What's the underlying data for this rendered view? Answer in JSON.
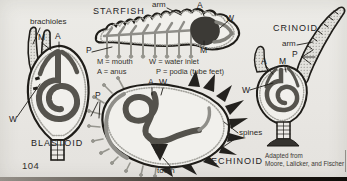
{
  "meta": {
    "page_number": "104"
  },
  "colors": {
    "paper": "#e9e7e3",
    "ink": "#1f1d19",
    "gut_dark_gray": "#56544e",
    "stomach_dark": "#3c3a36",
    "water_system_gray": "#8f8e89",
    "bottom_bar_dark": "#17120e"
  },
  "legend": {
    "m": "M = mouth",
    "a": "A = anus",
    "w": "W = water inlet",
    "p": "P = podia (tube feet)"
  },
  "credit": {
    "line1": "Adapted from",
    "line2": "Moore, Lalicker, and Fischer"
  },
  "figures": {
    "blastoid": {
      "title": "BLASTOID",
      "brachioles_label": "brachioles",
      "mouth": "M",
      "anus": "A",
      "water_inlet": "W"
    },
    "starfish": {
      "title": "STARFISH",
      "arm_label": "arm",
      "mouth": "M",
      "anus": "A",
      "water_inlet": "W",
      "podia": "P"
    },
    "echinoid": {
      "title": "ECHINOID",
      "mouth": "M",
      "anus": "A",
      "water_inlet": "W",
      "podia": "P",
      "spines_label": "spines",
      "tooth_label": "tooth"
    },
    "crinoid": {
      "title": "CRINOID",
      "arm_label": "arm",
      "mouth": "M",
      "anus": "A",
      "water_inlet": "W",
      "podia": "P"
    }
  }
}
